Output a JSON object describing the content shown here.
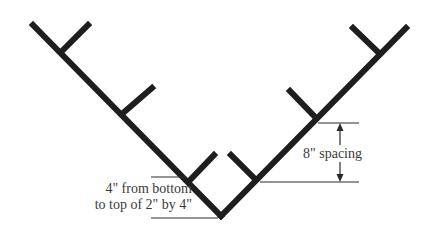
{
  "diagram": {
    "colors": {
      "beam": "#1e1e1e",
      "dimension_line": "#2a2a2a",
      "text": "#3a3a3a",
      "background": "#ffffff"
    },
    "annotations": {
      "bottom_offset_line1": "4\" from bottom",
      "bottom_offset_line2": "to top of 2\" by 4\"",
      "spacing": "8\" spacing"
    }
  }
}
